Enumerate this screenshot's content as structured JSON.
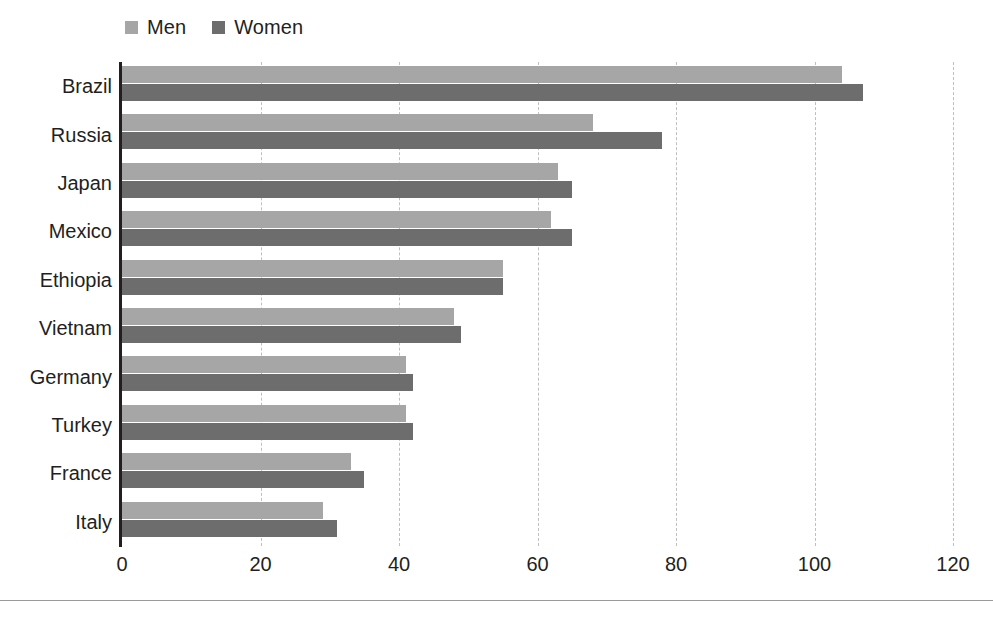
{
  "chart_data": {
    "type": "bar",
    "orientation": "horizontal",
    "title": "",
    "subtitle": "",
    "xlabel": "",
    "ylabel": "",
    "xlim": [
      0,
      120
    ],
    "ylim": null,
    "xticks": [
      0,
      20,
      40,
      60,
      80,
      100,
      120
    ],
    "xtick_labels": [
      "0",
      "20",
      "40",
      "60",
      "80",
      "100",
      "120"
    ],
    "grid": "vertical-dashed",
    "legend_position": "top-left",
    "categories": [
      "Brazil",
      "Russia",
      "Japan",
      "Mexico",
      "Ethiopia",
      "Vietnam",
      "Germany",
      "Turkey",
      "France",
      "Italy"
    ],
    "series": [
      {
        "name": "Men",
        "color": "#a6a6a6",
        "values": [
          104,
          68,
          63,
          62,
          55,
          48,
          41,
          41,
          33,
          29
        ]
      },
      {
        "name": "Women",
        "color": "#6d6d6d",
        "values": [
          107,
          78,
          65,
          65,
          55,
          49,
          42,
          42,
          35,
          31
        ]
      }
    ]
  },
  "legend": {
    "entries": [
      {
        "label": "Men",
        "swatch": "legend-swatch-men",
        "color": "#a6a6a6"
      },
      {
        "label": "Women",
        "swatch": "legend-swatch-women",
        "color": "#6d6d6d"
      }
    ]
  },
  "colors": {
    "men": "#a6a6a6",
    "women": "#6d6d6d",
    "axis": "#231f20",
    "gridline": "#bfbfbf",
    "text": "#231f20",
    "background": "#ffffff",
    "rule": "#9a9a9a"
  }
}
